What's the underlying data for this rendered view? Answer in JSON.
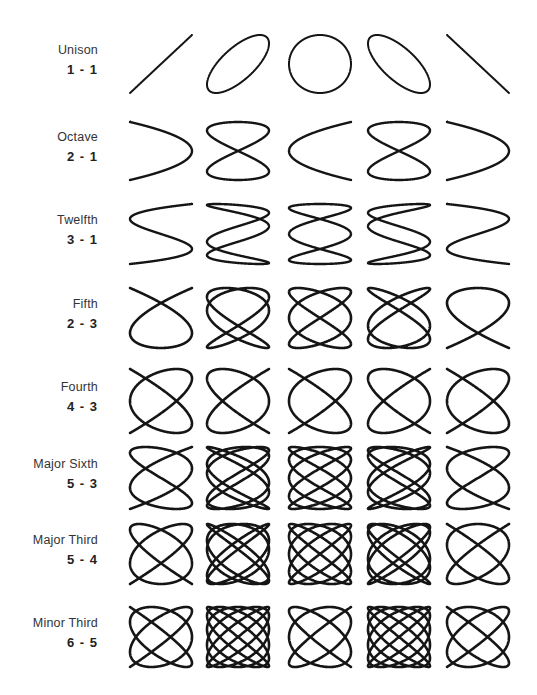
{
  "diagram": {
    "type": "lissajous-figures-musical-intervals",
    "columns": [
      "phase 0",
      "phase 1/4",
      "phase 1/2",
      "phase 3/4",
      "phase 1"
    ],
    "column_x": [
      128,
      205,
      287,
      366,
      445
    ],
    "figure_size": [
      66,
      64
    ],
    "rows": [
      {
        "name": "Unison",
        "ratio": "1-1",
        "fx": 1,
        "fy": 1,
        "top": 33,
        "height": 62,
        "stroke": 2.0
      },
      {
        "name": "Octave",
        "ratio": "2-1",
        "fx": 2,
        "fy": 1,
        "top": 120,
        "height": 62,
        "stroke": 2.4
      },
      {
        "name": "Twelfth",
        "ratio": "3-1",
        "fx": 3,
        "fy": 1,
        "top": 202,
        "height": 64,
        "stroke": 2.4
      },
      {
        "name": "Fifth",
        "ratio": "2-3",
        "fx": 3,
        "fy": 2,
        "top": 286,
        "height": 64,
        "stroke": 2.6
      },
      {
        "name": "Fourth",
        "ratio": "4-3",
        "fx": 4,
        "fy": 3,
        "top": 367,
        "height": 68,
        "stroke": 2.6
      },
      {
        "name": "Major Sixth",
        "ratio": "5-3",
        "fx": 5,
        "fy": 3,
        "top": 445,
        "height": 66,
        "stroke": 2.6
      },
      {
        "name": "Major Third",
        "ratio": "5-4",
        "fx": 5,
        "fy": 4,
        "top": 522,
        "height": 64,
        "stroke": 2.6
      },
      {
        "name": "Minor Third",
        "ratio": "6-5",
        "fx": 6,
        "fy": 5,
        "top": 605,
        "height": 64,
        "stroke": 2.6
      }
    ]
  }
}
